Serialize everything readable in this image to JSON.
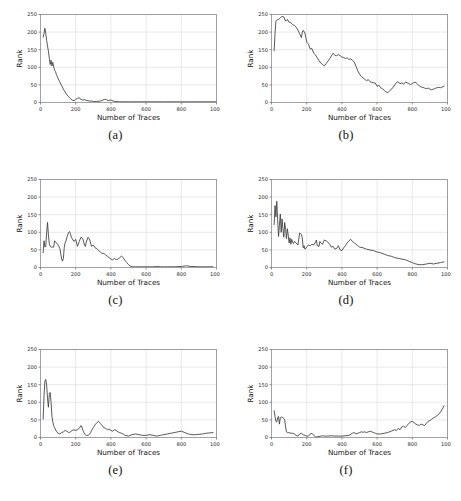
{
  "figure": {
    "panel_count": 6,
    "axis": {
      "xlabel": "Number of Traces",
      "ylabel": "Rank",
      "xticks": [
        0,
        200,
        400,
        600,
        800,
        1000
      ],
      "yticks": [
        0,
        50,
        100,
        150,
        200,
        250
      ],
      "xlim": [
        0,
        1000
      ],
      "ylim": [
        0,
        250
      ],
      "grid": true
    },
    "colors": {
      "line": "#3b3b3b",
      "grid": "#d9d9d9",
      "frame": "#8d8d8d",
      "text": "#111111",
      "background": "#ffffff"
    },
    "captions": [
      "(a)",
      "(b)",
      "(c)",
      "(d)",
      "(e)",
      "(f)"
    ]
  },
  "chart_data": [
    {
      "id": "a",
      "type": "line",
      "title": "",
      "caption": "(a)",
      "xlabel": "Number of Traces",
      "ylabel": "Rank",
      "xlim": [
        0,
        1000
      ],
      "ylim": [
        0,
        250
      ],
      "xticks": [
        0,
        200,
        400,
        600,
        800,
        1000
      ],
      "yticks": [
        0,
        50,
        100,
        150,
        200,
        250
      ],
      "grid": true,
      "legend": null,
      "x": [
        15,
        20,
        25,
        30,
        35,
        40,
        45,
        50,
        55,
        60,
        65,
        70,
        75,
        80,
        85,
        90,
        95,
        100,
        110,
        120,
        130,
        140,
        150,
        160,
        170,
        180,
        190,
        200,
        210,
        220,
        230,
        240,
        250,
        260,
        270,
        280,
        290,
        300,
        320,
        340,
        355,
        365,
        375,
        385,
        395,
        405,
        420,
        450,
        500,
        550,
        600,
        700,
        800,
        900,
        1000
      ],
      "y": [
        186,
        196,
        211,
        196,
        176,
        160,
        146,
        126,
        108,
        120,
        104,
        114,
        101,
        92,
        88,
        80,
        74,
        68,
        58,
        48,
        38,
        30,
        22,
        16,
        11,
        7,
        5,
        9,
        12,
        13,
        9,
        7,
        8,
        6,
        5,
        4,
        4,
        3,
        3,
        4,
        7,
        9,
        8,
        5,
        7,
        6,
        3,
        2,
        2,
        2,
        2,
        2,
        2,
        2,
        2
      ]
    },
    {
      "id": "b",
      "type": "line",
      "title": "",
      "caption": "(b)",
      "xlabel": "Number of Traces",
      "ylabel": "Rank",
      "xlim": [
        0,
        1000
      ],
      "ylim": [
        0,
        250
      ],
      "xticks": [
        0,
        200,
        400,
        600,
        800,
        1000
      ],
      "yticks": [
        0,
        50,
        100,
        150,
        200,
        250
      ],
      "grid": true,
      "legend": null,
      "x": [
        15,
        20,
        25,
        30,
        40,
        50,
        60,
        70,
        80,
        90,
        100,
        110,
        120,
        130,
        140,
        150,
        160,
        170,
        175,
        180,
        190,
        200,
        205,
        210,
        220,
        230,
        240,
        250,
        260,
        270,
        280,
        290,
        300,
        310,
        320,
        330,
        340,
        350,
        360,
        370,
        380,
        390,
        400,
        410,
        420,
        430,
        440,
        450,
        460,
        470,
        480,
        490,
        500,
        510,
        520,
        530,
        540,
        550,
        560,
        570,
        580,
        590,
        600,
        610,
        620,
        630,
        640,
        650,
        660,
        670,
        680,
        690,
        700,
        710,
        720,
        730,
        740,
        750,
        760,
        770,
        780,
        790,
        800,
        810,
        820,
        830,
        840,
        850,
        860,
        870,
        880,
        890,
        900,
        910,
        920,
        930,
        940,
        950,
        960,
        970,
        980
      ],
      "y": [
        147,
        196,
        232,
        234,
        236,
        240,
        245,
        243,
        231,
        236,
        228,
        227,
        221,
        219,
        214,
        206,
        195,
        184,
        200,
        205,
        197,
        172,
        168,
        166,
        152,
        153,
        140,
        135,
        127,
        119,
        112,
        108,
        104,
        110,
        117,
        124,
        132,
        140,
        134,
        133,
        136,
        133,
        129,
        128,
        125,
        127,
        122,
        124,
        120,
        115,
        103,
        90,
        81,
        74,
        70,
        66,
        62,
        65,
        59,
        57,
        56,
        55,
        46,
        49,
        42,
        39,
        35,
        30,
        28,
        32,
        38,
        42,
        50,
        57,
        59,
        53,
        56,
        52,
        58,
        56,
        54,
        51,
        54,
        57,
        57,
        52,
        47,
        44,
        43,
        41,
        39,
        41,
        38,
        36,
        38,
        40,
        42,
        43,
        42,
        44,
        46
      ]
    },
    {
      "id": "c",
      "type": "line",
      "title": "",
      "caption": "(c)",
      "xlabel": "Number of Traces",
      "ylabel": "Rank",
      "xlim": [
        0,
        1000
      ],
      "ylim": [
        0,
        250
      ],
      "xticks": [
        0,
        200,
        400,
        600,
        800,
        1000
      ],
      "yticks": [
        0,
        50,
        100,
        150,
        200,
        250
      ],
      "grid": true,
      "legend": null,
      "x": [
        15,
        20,
        25,
        30,
        35,
        40,
        45,
        50,
        55,
        60,
        65,
        70,
        75,
        80,
        90,
        100,
        110,
        120,
        125,
        130,
        135,
        140,
        145,
        150,
        160,
        165,
        170,
        175,
        180,
        190,
        200,
        210,
        215,
        220,
        230,
        240,
        250,
        255,
        260,
        270,
        275,
        280,
        290,
        300,
        310,
        320,
        330,
        340,
        350,
        360,
        370,
        380,
        390,
        400,
        410,
        420,
        430,
        440,
        450,
        460,
        470,
        480,
        490,
        500,
        510,
        520,
        530,
        540,
        560,
        580,
        600,
        640,
        660,
        680,
        700,
        720,
        760,
        800,
        830,
        850,
        900,
        950,
        980
      ],
      "y": [
        42,
        76,
        58,
        60,
        100,
        128,
        92,
        68,
        60,
        58,
        58,
        58,
        58,
        76,
        70,
        64,
        54,
        24,
        18,
        26,
        58,
        70,
        76,
        86,
        100,
        102,
        96,
        86,
        82,
        74,
        80,
        60,
        66,
        74,
        86,
        82,
        64,
        60,
        72,
        86,
        82,
        78,
        60,
        64,
        56,
        54,
        48,
        44,
        40,
        40,
        36,
        32,
        28,
        24,
        22,
        26,
        22,
        24,
        28,
        32,
        28,
        20,
        14,
        8,
        4,
        2,
        2,
        2,
        2,
        2,
        2,
        2,
        3,
        2,
        2,
        2,
        2,
        3,
        5,
        3,
        2,
        2,
        2
      ]
    },
    {
      "id": "d",
      "type": "line",
      "title": "",
      "caption": "(d)",
      "xlabel": "Number of Traces",
      "ylabel": "Rank",
      "xlim": [
        0,
        1000
      ],
      "ylim": [
        0,
        250
      ],
      "xticks": [
        0,
        200,
        400,
        600,
        800,
        1000
      ],
      "yticks": [
        0,
        50,
        100,
        150,
        200,
        250
      ],
      "grid": true,
      "legend": null,
      "x": [
        15,
        20,
        25,
        30,
        35,
        40,
        45,
        50,
        55,
        60,
        65,
        70,
        75,
        80,
        85,
        90,
        95,
        100,
        105,
        110,
        115,
        120,
        125,
        130,
        140,
        150,
        160,
        170,
        175,
        180,
        185,
        190,
        200,
        210,
        220,
        230,
        240,
        250,
        255,
        260,
        270,
        275,
        280,
        290,
        300,
        310,
        320,
        330,
        340,
        350,
        360,
        370,
        380,
        390,
        400,
        410,
        420,
        430,
        440,
        450,
        460,
        470,
        480,
        490,
        500,
        520,
        540,
        560,
        580,
        600,
        620,
        640,
        660,
        680,
        700,
        720,
        740,
        760,
        780,
        800,
        820,
        840,
        860,
        880,
        900,
        920,
        940,
        960,
        980
      ],
      "y": [
        122,
        176,
        144,
        188,
        136,
        88,
        120,
        152,
        100,
        138,
        110,
        86,
        128,
        108,
        82,
        110,
        92,
        70,
        84,
        66,
        80,
        72,
        68,
        74,
        70,
        64,
        98,
        94,
        84,
        56,
        62,
        52,
        58,
        64,
        62,
        66,
        64,
        72,
        78,
        62,
        60,
        74,
        70,
        66,
        78,
        76,
        72,
        66,
        58,
        60,
        52,
        54,
        62,
        50,
        48,
        56,
        62,
        70,
        76,
        80,
        74,
        70,
        66,
        62,
        58,
        56,
        52,
        50,
        48,
        44,
        42,
        38,
        34,
        32,
        28,
        26,
        24,
        22,
        18,
        14,
        10,
        8,
        8,
        10,
        12,
        10,
        12,
        14,
        16
      ]
    },
    {
      "id": "e",
      "type": "line",
      "title": "",
      "caption": "(e)",
      "xlabel": "Number of Traces",
      "ylabel": "Rank",
      "xlim": [
        0,
        1000
      ],
      "ylim": [
        0,
        250
      ],
      "xticks": [
        0,
        200,
        400,
        600,
        800,
        1000
      ],
      "yticks": [
        0,
        50,
        100,
        150,
        200,
        250
      ],
      "grid": true,
      "legend": null,
      "x": [
        15,
        20,
        25,
        30,
        35,
        40,
        45,
        50,
        55,
        60,
        65,
        70,
        75,
        80,
        90,
        100,
        110,
        120,
        130,
        140,
        150,
        160,
        170,
        180,
        190,
        200,
        210,
        220,
        230,
        235,
        240,
        245,
        250,
        260,
        270,
        280,
        285,
        290,
        300,
        310,
        320,
        330,
        340,
        350,
        355,
        360,
        370,
        380,
        390,
        400,
        410,
        420,
        430,
        440,
        450,
        460,
        470,
        480,
        490,
        500,
        520,
        540,
        560,
        580,
        600,
        620,
        640,
        660,
        680,
        700,
        720,
        740,
        760,
        780,
        800,
        820,
        840,
        860,
        880,
        900,
        920,
        940,
        960,
        980
      ],
      "y": [
        52,
        118,
        160,
        165,
        148,
        110,
        86,
        122,
        128,
        100,
        60,
        44,
        34,
        28,
        18,
        12,
        10,
        14,
        16,
        20,
        18,
        14,
        16,
        20,
        22,
        20,
        22,
        26,
        34,
        30,
        22,
        16,
        10,
        6,
        6,
        10,
        14,
        20,
        28,
        36,
        42,
        46,
        40,
        34,
        30,
        28,
        26,
        22,
        24,
        20,
        18,
        22,
        20,
        16,
        14,
        12,
        10,
        6,
        5,
        4,
        8,
        10,
        8,
        6,
        6,
        8,
        6,
        4,
        6,
        8,
        10,
        12,
        14,
        16,
        18,
        14,
        10,
        8,
        8,
        9,
        10,
        12,
        13,
        14
      ]
    },
    {
      "id": "f",
      "type": "line",
      "title": "",
      "caption": "(f)",
      "xlabel": "Number of Traces",
      "ylabel": "Rank",
      "xlim": [
        0,
        1000
      ],
      "ylim": [
        0,
        250
      ],
      "xticks": [
        0,
        200,
        400,
        600,
        800,
        1000
      ],
      "yticks": [
        0,
        50,
        100,
        150,
        200,
        250
      ],
      "grid": true,
      "legend": null,
      "x": [
        15,
        20,
        25,
        30,
        35,
        40,
        45,
        50,
        55,
        60,
        65,
        70,
        75,
        80,
        85,
        90,
        95,
        100,
        110,
        120,
        130,
        140,
        150,
        160,
        170,
        180,
        190,
        200,
        210,
        220,
        230,
        240,
        250,
        260,
        270,
        280,
        290,
        300,
        320,
        340,
        360,
        380,
        400,
        420,
        440,
        460,
        470,
        480,
        490,
        500,
        510,
        520,
        530,
        540,
        550,
        560,
        570,
        580,
        590,
        600,
        620,
        640,
        660,
        680,
        700,
        710,
        720,
        730,
        740,
        750,
        760,
        770,
        780,
        790,
        800,
        810,
        820,
        830,
        840,
        850,
        860,
        870,
        880,
        890,
        900,
        910,
        920,
        930,
        940,
        950,
        960,
        970,
        980
      ],
      "y": [
        76,
        60,
        46,
        44,
        56,
        60,
        38,
        56,
        58,
        58,
        56,
        54,
        50,
        30,
        16,
        14,
        14,
        14,
        12,
        12,
        10,
        6,
        4,
        10,
        12,
        8,
        6,
        4,
        4,
        10,
        12,
        6,
        2,
        2,
        3,
        4,
        5,
        4,
        4,
        5,
        4,
        4,
        4,
        5,
        6,
        12,
        14,
        10,
        12,
        14,
        16,
        15,
        16,
        14,
        16,
        18,
        16,
        14,
        12,
        10,
        10,
        12,
        14,
        18,
        22,
        20,
        26,
        22,
        30,
        32,
        28,
        34,
        40,
        44,
        46,
        42,
        38,
        36,
        34,
        38,
        36,
        34,
        40,
        46,
        48,
        52,
        56,
        58,
        62,
        66,
        72,
        80,
        90
      ]
    }
  ]
}
